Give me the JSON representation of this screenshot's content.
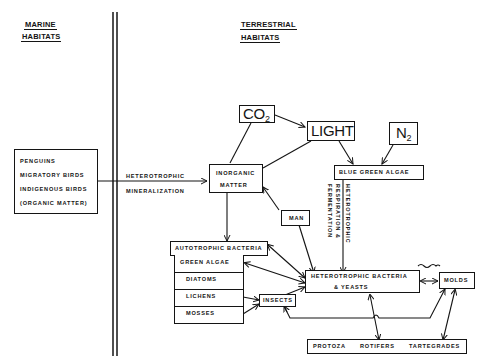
{
  "headers": {
    "marine_line1": "MARINE",
    "marine_line2": "HABITATS",
    "terrestrial_line1": "TERRESTRIAL",
    "terrestrial_line2": "HABITATS"
  },
  "marine_box": {
    "items": [
      "PENGUINS",
      "MIGRATORY  BIRDS",
      "INDIGENOUS  BIRDS",
      "(ORGANIC  MATTER)"
    ]
  },
  "process_labels": {
    "heterotrophic": "HETEROTROPHIC",
    "mineralization": "MINERALIZATION",
    "vertical_1": "HETEROTROPHIC",
    "vertical_2": "RESPIRATION  &",
    "vertical_3": "FERMENTATION"
  },
  "nodes": {
    "co2": {
      "base": "CO",
      "sub": "2"
    },
    "light": "LIGHT",
    "n2": {
      "base": "N",
      "sub": "2"
    },
    "inorganic_line1": "INORGANIC",
    "inorganic_line2": "MATTER",
    "blue_green_algae": "BLUE  GREEN  ALGAE",
    "man": "MAN",
    "autotrophic_bacteria": "AUTOTROPHIC  BACTERIA",
    "autotroph_stack": [
      "GREEN  ALGAE",
      "DIATOMS",
      "LICHENS",
      "MOSSES"
    ],
    "insects": "INSECTS",
    "hetero_bacteria_line1": "HETEROTROPHIC  BACTERIA",
    "hetero_bacteria_line2": "&  YEASTS",
    "molds": "MOLDS",
    "bottom_group": [
      "PROTOZA",
      "ROTIFERS",
      "TARTEGRADES"
    ]
  },
  "colors": {
    "ink": "#141414",
    "paper": "#ffffff"
  }
}
